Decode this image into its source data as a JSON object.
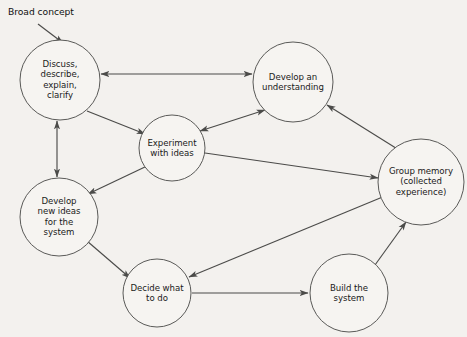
{
  "diagram": {
    "background_color": "#f3f1ee",
    "node_fill": "#f6f4f1",
    "node_stroke": "#5a5a58",
    "edge_color": "#4b4b49",
    "text_color": "#1a1a1a",
    "annotations": [
      {
        "id": "broad-concept",
        "text": "Broad concept",
        "x": 8,
        "y": 6
      }
    ],
    "nodes": [
      {
        "id": "discuss",
        "label": "Discuss,\ndescribe,\nexplain,\nclarify",
        "cx": 60,
        "cy": 80,
        "r": 40
      },
      {
        "id": "develop-understanding",
        "label": "Develop an\nunderstanding",
        "cx": 293,
        "cy": 82,
        "r": 40
      },
      {
        "id": "experiment",
        "label": "Experiment\nwith ideas",
        "cx": 172,
        "cy": 148,
        "r": 33
      },
      {
        "id": "group-memory",
        "label": "Group memory\n(collected\nexperience)",
        "cx": 421,
        "cy": 182,
        "r": 43
      },
      {
        "id": "develop-new-ideas",
        "label": "Develop\nnew ideas\nfor the\nsystem",
        "cx": 59,
        "cy": 217,
        "r": 39
      },
      {
        "id": "decide",
        "label": "Decide what\nto do",
        "cx": 157,
        "cy": 293,
        "r": 34
      },
      {
        "id": "build",
        "label": "Build the\nsystem",
        "cx": 349,
        "cy": 293,
        "r": 39
      }
    ],
    "edges": [
      {
        "id": "broad-to-discuss",
        "from": "broad-concept",
        "to": "discuss",
        "direction": "one-way"
      },
      {
        "id": "discuss-understanding",
        "from": "discuss",
        "to": "develop-understanding",
        "direction": "two-way"
      },
      {
        "id": "discuss-experiment",
        "from": "discuss",
        "to": "experiment",
        "direction": "one-way"
      },
      {
        "id": "discuss-new-ideas",
        "from": "discuss",
        "to": "develop-new-ideas",
        "direction": "two-way"
      },
      {
        "id": "experiment-understanding",
        "from": "experiment",
        "to": "develop-understanding",
        "direction": "two-way"
      },
      {
        "id": "experiment-new-ideas",
        "from": "experiment",
        "to": "develop-new-ideas",
        "direction": "one-way"
      },
      {
        "id": "experiment-group-memory",
        "from": "experiment",
        "to": "group-memory",
        "direction": "one-way"
      },
      {
        "id": "group-memory-understanding",
        "from": "group-memory",
        "to": "develop-understanding",
        "direction": "one-way"
      },
      {
        "id": "group-memory-decide",
        "from": "group-memory",
        "to": "decide",
        "direction": "one-way"
      },
      {
        "id": "new-ideas-decide",
        "from": "develop-new-ideas",
        "to": "decide",
        "direction": "one-way"
      },
      {
        "id": "decide-build",
        "from": "decide",
        "to": "build",
        "direction": "one-way"
      },
      {
        "id": "build-group-memory",
        "from": "build",
        "to": "group-memory",
        "direction": "one-way"
      }
    ]
  }
}
